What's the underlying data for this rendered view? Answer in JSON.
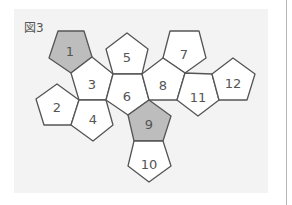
{
  "figure": {
    "label": "図3",
    "colors": {
      "panel_bg": "#f3f3f3",
      "face_fill": "#ffffff",
      "highlight_fill": "#bdbdbd",
      "stroke": "#555555",
      "text": "#555555"
    },
    "faces": [
      {
        "id": "1",
        "highlighted": true,
        "points": [
          [
            58,
            31
          ],
          [
            84,
            31
          ],
          [
            92,
            57
          ],
          [
            71,
            73
          ],
          [
            49,
            58
          ]
        ],
        "label_pos": [
          70,
          52
        ]
      },
      {
        "id": "2",
        "highlighted": false,
        "points": [
          [
            57,
            84
          ],
          [
            79,
            100
          ],
          [
            71,
            125
          ],
          [
            44,
            125
          ],
          [
            36,
            99
          ]
        ],
        "label_pos": [
          57,
          108
        ]
      },
      {
        "id": "3",
        "highlighted": false,
        "points": [
          [
            92,
            57
          ],
          [
            113,
            74
          ],
          [
            106,
            100
          ],
          [
            79,
            100
          ],
          [
            71,
            73
          ]
        ],
        "label_pos": [
          92,
          85
        ]
      },
      {
        "id": "4",
        "highlighted": false,
        "points": [
          [
            79,
            100
          ],
          [
            106,
            100
          ],
          [
            113,
            125
          ],
          [
            93,
            141
          ],
          [
            71,
            125
          ]
        ],
        "label_pos": [
          93,
          120
        ]
      },
      {
        "id": "5",
        "highlighted": false,
        "points": [
          [
            127,
            33
          ],
          [
            148,
            49
          ],
          [
            142,
            74
          ],
          [
            113,
            74
          ],
          [
            106,
            49
          ]
        ],
        "label_pos": [
          127,
          58
        ]
      },
      {
        "id": "6",
        "highlighted": false,
        "points": [
          [
            113,
            74
          ],
          [
            142,
            74
          ],
          [
            149,
            100
          ],
          [
            128,
            115
          ],
          [
            106,
            100
          ]
        ],
        "label_pos": [
          127,
          97
        ]
      },
      {
        "id": "7",
        "highlighted": false,
        "points": [
          [
            170,
            31
          ],
          [
            199,
            31
          ],
          [
            206,
            58
          ],
          [
            185,
            73
          ],
          [
            163,
            58
          ]
        ],
        "label_pos": [
          184,
          55
        ]
      },
      {
        "id": "8",
        "highlighted": false,
        "points": [
          [
            163,
            58
          ],
          [
            185,
            73
          ],
          [
            177,
            100
          ],
          [
            149,
            100
          ],
          [
            142,
            74
          ]
        ],
        "label_pos": [
          163,
          86
        ]
      },
      {
        "id": "9",
        "highlighted": true,
        "points": [
          [
            149,
            100
          ],
          [
            171,
            116
          ],
          [
            163,
            141
          ],
          [
            134,
            141
          ],
          [
            128,
            115
          ]
        ],
        "label_pos": [
          149,
          125
        ]
      },
      {
        "id": "10",
        "highlighted": false,
        "points": [
          [
            134,
            141
          ],
          [
            163,
            141
          ],
          [
            171,
            166
          ],
          [
            149,
            182
          ],
          [
            128,
            166
          ]
        ],
        "label_pos": [
          149,
          165
        ]
      },
      {
        "id": "11",
        "highlighted": false,
        "points": [
          [
            185,
            73
          ],
          [
            212,
            74
          ],
          [
            219,
            100
          ],
          [
            198,
            116
          ],
          [
            177,
            100
          ]
        ],
        "label_pos": [
          198,
          98
        ]
      },
      {
        "id": "12",
        "highlighted": false,
        "points": [
          [
            233,
            58
          ],
          [
            255,
            74
          ],
          [
            247,
            100
          ],
          [
            219,
            100
          ],
          [
            212,
            74
          ]
        ],
        "label_pos": [
          233,
          84
        ]
      }
    ]
  }
}
